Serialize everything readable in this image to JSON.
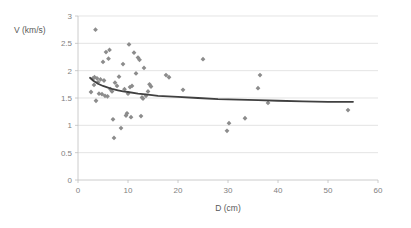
{
  "chart_data": {
    "type": "scatter",
    "title": "",
    "xlabel": "D (cm)",
    "ylabel": "V (km/s)",
    "xlim": [
      0,
      60
    ],
    "ylim": [
      0,
      3
    ],
    "xticks": [
      "0",
      "10",
      "20",
      "30",
      "40",
      "50",
      "60"
    ],
    "yticks": [
      "0",
      "0.5",
      "1",
      "1.5",
      "2",
      "2.5",
      "3"
    ],
    "xtick_values": [
      0,
      10,
      20,
      30,
      40,
      50,
      60
    ],
    "ytick_values": [
      0,
      0.5,
      1,
      1.5,
      2,
      2.5,
      3
    ],
    "grid": "horizontal",
    "legend": "none",
    "marker_shape": "diamond",
    "marker_color": "#8c8c8c",
    "trendline_color": "#404040",
    "series": [
      {
        "name": "observations",
        "points": [
          [
            2.6,
            1.61
          ],
          [
            3.0,
            1.86
          ],
          [
            3.2,
            1.74
          ],
          [
            3.3,
            1.88
          ],
          [
            3.5,
            2.75
          ],
          [
            3.6,
            1.45
          ],
          [
            3.8,
            1.86
          ],
          [
            4.0,
            1.79
          ],
          [
            4.2,
            1.58
          ],
          [
            4.5,
            1.84
          ],
          [
            4.8,
            1.57
          ],
          [
            5.0,
            2.16
          ],
          [
            5.2,
            1.82
          ],
          [
            5.4,
            1.54
          ],
          [
            5.6,
            2.34
          ],
          [
            5.9,
            1.53
          ],
          [
            6.1,
            2.22
          ],
          [
            6.3,
            2.38
          ],
          [
            6.5,
            1.66
          ],
          [
            6.8,
            1.62
          ],
          [
            7.0,
            1.11
          ],
          [
            7.2,
            0.77
          ],
          [
            7.4,
            1.78
          ],
          [
            7.8,
            1.72
          ],
          [
            8.2,
            1.89
          ],
          [
            8.6,
            0.95
          ],
          [
            9.0,
            2.12
          ],
          [
            9.3,
            1.66
          ],
          [
            9.6,
            1.18
          ],
          [
            9.8,
            1.22
          ],
          [
            10.0,
            1.58
          ],
          [
            10.2,
            2.48
          ],
          [
            10.4,
            1.7
          ],
          [
            10.6,
            1.15
          ],
          [
            10.8,
            1.72
          ],
          [
            11.2,
            2.33
          ],
          [
            11.6,
            1.95
          ],
          [
            12.0,
            2.24
          ],
          [
            12.3,
            2.2
          ],
          [
            12.6,
            1.17
          ],
          [
            12.8,
            1.51
          ],
          [
            13.0,
            1.49
          ],
          [
            13.2,
            2.05
          ],
          [
            13.6,
            1.54
          ],
          [
            14.0,
            1.62
          ],
          [
            14.3,
            1.75
          ],
          [
            14.6,
            1.71
          ],
          [
            17.6,
            1.92
          ],
          [
            18.2,
            1.88
          ],
          [
            21.0,
            1.65
          ],
          [
            25.0,
            2.21
          ],
          [
            29.8,
            0.9
          ],
          [
            30.2,
            1.04
          ],
          [
            33.4,
            1.13
          ],
          [
            36.0,
            1.68
          ],
          [
            36.4,
            1.92
          ],
          [
            38.0,
            1.41
          ],
          [
            54.0,
            1.28
          ]
        ]
      }
    ],
    "trendline": {
      "type": "power",
      "points": [
        [
          2.4,
          1.87
        ],
        [
          3.0,
          1.82
        ],
        [
          4.0,
          1.76
        ],
        [
          5.0,
          1.72
        ],
        [
          6.0,
          1.69
        ],
        [
          7.0,
          1.66
        ],
        [
          8.0,
          1.64
        ],
        [
          9.0,
          1.62
        ],
        [
          10.0,
          1.61
        ],
        [
          12.0,
          1.58
        ],
        [
          14.0,
          1.56
        ],
        [
          16.0,
          1.54
        ],
        [
          18.0,
          1.53
        ],
        [
          20.0,
          1.52
        ],
        [
          24.0,
          1.5
        ],
        [
          28.0,
          1.48
        ],
        [
          32.0,
          1.47
        ],
        [
          36.0,
          1.46
        ],
        [
          40.0,
          1.45
        ],
        [
          45.0,
          1.44
        ],
        [
          50.0,
          1.43
        ],
        [
          55.0,
          1.43
        ]
      ]
    }
  }
}
